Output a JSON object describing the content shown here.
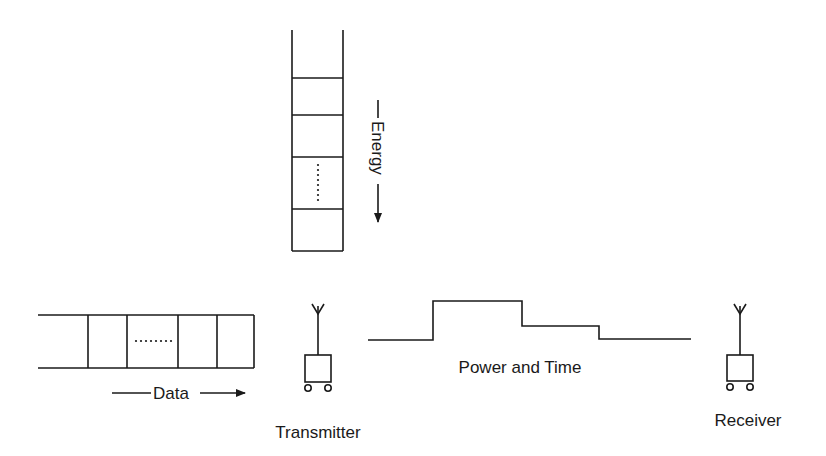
{
  "diagram": {
    "labels": {
      "energy": "Energy",
      "data": "Data",
      "power_time": "Power and Time",
      "transmitter": "Transmitter",
      "receiver": "Receiver"
    },
    "energy_queue": {
      "orientation": "vertical",
      "cells": 4,
      "ellipsis": "·······",
      "direction": "down"
    },
    "data_queue": {
      "orientation": "horizontal",
      "cells": 5,
      "ellipsis": "·······",
      "direction": "right"
    },
    "power_profile": {
      "levels": [
        "low",
        "high",
        "medium",
        "low"
      ]
    },
    "colors": {
      "stroke": "#1a1a1a",
      "background": "#ffffff"
    }
  }
}
